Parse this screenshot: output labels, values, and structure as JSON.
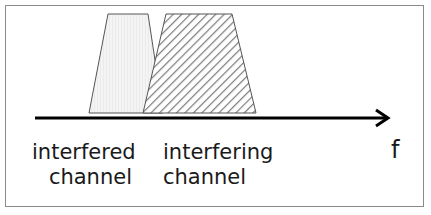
{
  "diagram": {
    "axis": {
      "label": "f",
      "direction": "right"
    },
    "channels": [
      {
        "id": "interfered",
        "line1": "interfered",
        "line2": "channel",
        "fill": "#f2f2f2",
        "pattern": "light-dotted"
      },
      {
        "id": "interfering",
        "line1": "interfering",
        "line2": "channel",
        "fill": "hatched",
        "pattern": "diagonal-hatch"
      }
    ],
    "colors": {
      "stroke": "#555555",
      "axis": "#000000",
      "border": "#8a8a8a"
    }
  }
}
